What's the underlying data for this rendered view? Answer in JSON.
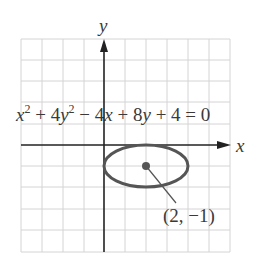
{
  "diagram": {
    "type": "coordinate-plane-ellipse",
    "axes": {
      "x_label": "x",
      "y_label": "y"
    },
    "grid": {
      "columns": 10,
      "rows": 10,
      "cell_px": 21,
      "line_color": "#d4d4d4"
    },
    "equation": {
      "text": "x² + 4y² − 4x + 8y + 4 = 0",
      "parts": {
        "x": "x",
        "exp1": "2",
        "plus1": " + 4",
        "y": "y",
        "exp2": "2",
        "minus": " − 4",
        "x2": "x",
        "plus2": " + 8",
        "y2": "y",
        "tail": " + 4 = 0"
      }
    },
    "ellipse": {
      "center": [
        2,
        -1
      ],
      "semi_major_x": 2,
      "semi_minor_y": 1,
      "stroke_color": "#555555"
    },
    "center_point": {
      "label": "(2, −1)",
      "color": "#555555"
    }
  }
}
